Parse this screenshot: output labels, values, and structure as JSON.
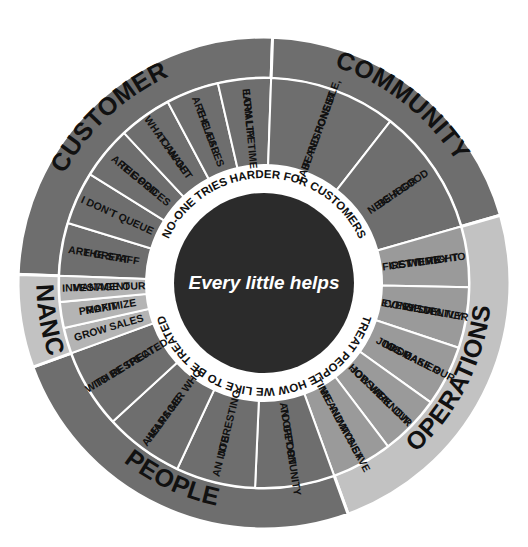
{
  "page": {
    "background_color": "#ffffff"
  },
  "margin_notes": {
    "line1": "re",
    "line2": "s:",
    "line3": "ng",
    "line4": "d"
  },
  "center": {
    "text": "Every little helps",
    "fill": "#2b2b2b",
    "text_color": "#ffffff"
  },
  "inner_ring": {
    "fill": "#ffffff",
    "top_text": "NO-ONE TRIES HARDER FOR CUSTOMERS",
    "bottom_text": "TREAT PEOPLE HOW WE LIKE TO BE TREATED"
  },
  "colors": {
    "customer": "#6e6e6e",
    "community": "#6e6e6e",
    "operations_outer": "#c2c2c2",
    "operations_inner": "#9a9a9a",
    "people": "#6e6e6e",
    "finance_outer": "#c2c2c2",
    "finance_inner": "#b4b4b4",
    "divider": "#ffffff",
    "text_dark": "#111111"
  },
  "quadrants": [
    {
      "key": "customer",
      "label": "CUSTOMER",
      "outer_fill": "#6e6e6e",
      "inner_fill": "#6e6e6e",
      "segments": [
        {
          "lines": [
            "THE STAFF",
            "ARE GREAT"
          ]
        },
        {
          "lines": [
            "I DON'T QUEUE"
          ]
        },
        {
          "lines": [
            "THE PRICES",
            "ARE GOOD"
          ]
        },
        {
          "lines": [
            "I CAN GET",
            "WHAT I WANT"
          ]
        },
        {
          "lines": [
            "THE AISLES",
            "ARE CLEAR"
          ]
        },
        {
          "lines": [
            "EARN LIFETIME",
            "LOYALTY"
          ]
        }
      ]
    },
    {
      "key": "community",
      "label": "COMMUNITY",
      "outer_fill": "#6e6e6e",
      "inner_fill": "#6e6e6e",
      "segments": [
        {
          "lines": [
            "BE RESPONSIBLE,",
            "FAIR AND HONEST"
          ]
        },
        {
          "lines": [
            "BE A GOOD",
            "NEIGHBOR"
          ]
        }
      ]
    },
    {
      "key": "operations",
      "label": "OPERATIONS",
      "outer_fill": "#c2c2c2",
      "inner_fill": "#9a9a9a",
      "segments": [
        {
          "lines": [
            "WE TRY TO",
            "GET IT RIGHT",
            "FIRST TIME"
          ]
        },
        {
          "lines": [
            "WE DELIVER",
            "CONSISTENTLY",
            "EVERY DAY"
          ]
        },
        {
          "lines": [
            "WE MAKE OUR",
            "JOBS EASIER",
            "TO DO"
          ]
        },
        {
          "lines": [
            "WE KNOW",
            "HOW VITAL OUR",
            "JOBS ARE"
          ]
        },
        {
          "lines": [
            "WE ALWAYS SAVE",
            "TIME AND MONEY"
          ]
        }
      ]
    },
    {
      "key": "people",
      "label": "PEOPLE",
      "outer_fill": "#6e6e6e",
      "inner_fill": "#6e6e6e",
      "segments": [
        {
          "lines": [
            "AN OPPORTUNITY",
            "TO GET ON"
          ]
        },
        {
          "lines": [
            "AN INTERESTING",
            "JOB"
          ]
        },
        {
          "lines": [
            "A MANAGER WHO",
            "HELPS ME"
          ]
        },
        {
          "lines": [
            "TO BE TREATED",
            "WITH RESPECT"
          ]
        }
      ]
    },
    {
      "key": "finance",
      "label": "FINANCE",
      "outer_fill": "#c2c2c2",
      "inner_fill": "#b4b4b4",
      "segments": [
        {
          "lines": [
            "GROW SALES"
          ]
        },
        {
          "lines": [
            "MAXIMIZE",
            "PROFIT"
          ]
        },
        {
          "lines": [
            "MANAGE OUR",
            "INVESTMENT"
          ]
        }
      ]
    }
  ]
}
